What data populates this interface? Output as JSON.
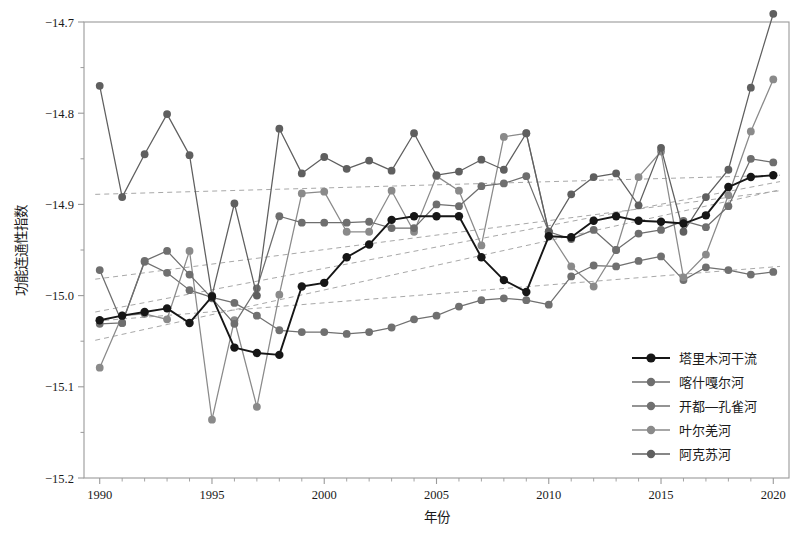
{
  "chart_data": {
    "type": "line",
    "title": "",
    "xlabel": "年份",
    "ylabel": "功能连通性指数",
    "xlim": [
      1989.3,
      2020.7
    ],
    "ylim": [
      -15.2,
      -14.7
    ],
    "grid": false,
    "legend_position": "right-bottom",
    "x_ticks": [
      1990,
      1995,
      2000,
      2005,
      2010,
      2015,
      2020
    ],
    "y_ticks": [
      -14.7,
      -14.8,
      -14.9,
      -15.0,
      -15.1,
      -15.2
    ],
    "y_tick_labels": [
      "−14.7",
      "−14.8",
      "−14.9",
      "−15.0",
      "−15.1",
      "−15.2"
    ],
    "y_minor_ticks": [
      -14.75,
      -14.85,
      -14.95,
      -15.05,
      -15.15
    ],
    "x": [
      1990,
      1991,
      1992,
      1993,
      1994,
      1995,
      1996,
      1997,
      1998,
      1999,
      2000,
      2001,
      2002,
      2003,
      2004,
      2005,
      2006,
      2007,
      2008,
      2009,
      2010,
      2011,
      2012,
      2013,
      2014,
      2015,
      2016,
      2017,
      2018,
      2019,
      2020
    ],
    "series": [
      {
        "name": "塔里木河干流",
        "color": "#161616",
        "values": [
          -15.027,
          -15.022,
          -15.018,
          -15.014,
          -15.03,
          -15.001,
          -15.057,
          -15.063,
          -15.065,
          -14.99,
          -14.986,
          -14.958,
          -14.944,
          -14.917,
          -14.913,
          -14.913,
          -14.913,
          -14.958,
          -14.983,
          -14.996,
          -14.935,
          -14.936,
          -14.918,
          -14.913,
          -14.918,
          -14.919,
          -14.921,
          -14.912,
          -14.881,
          -14.87,
          -14.868
        ],
        "trend": {
          "start": -15.046,
          "end": -14.88
        }
      },
      {
        "name": "喀什嘎尔河",
        "color": "#6e6e6e",
        "values": [
          -14.972,
          -15.03,
          -14.962,
          -14.951,
          -14.977,
          -15.003,
          -15.031,
          -14.992,
          -14.913,
          -14.92,
          -14.92,
          -14.92,
          -14.919,
          -14.926,
          -14.926,
          -14.9,
          -14.902,
          -14.88,
          -14.877,
          -14.869,
          -14.93,
          -14.938,
          -14.928,
          -14.95,
          -14.932,
          -14.928,
          -14.918,
          -14.925,
          -14.902,
          -14.85,
          -14.854
        ]
      },
      {
        "name": "开都—孔雀河",
        "color": "#707070",
        "values": [
          -15.031,
          -15.03,
          -14.963,
          -14.975,
          -14.994,
          -15.002,
          -15.008,
          -15.022,
          -15.038,
          -15.04,
          -15.04,
          -15.042,
          -15.04,
          -15.035,
          -15.026,
          -15.022,
          -15.012,
          -15.005,
          -15.003,
          -15.005,
          -15.01,
          -14.979,
          -14.967,
          -14.968,
          -14.962,
          -14.957,
          -14.983,
          -14.969,
          -14.972,
          -14.977,
          -14.974
        ]
      },
      {
        "name": "叶尔羌河",
        "color": "#8a8a8a",
        "values": [
          -15.079,
          -15.022,
          -15.02,
          -15.026,
          -14.951,
          -15.136,
          -15.027,
          -15.122,
          -14.999,
          -14.888,
          -14.886,
          -14.93,
          -14.93,
          -14.885,
          -14.93,
          -14.869,
          -14.885,
          -14.945,
          -14.826,
          -14.822,
          -14.93,
          -14.968,
          -14.99,
          -14.95,
          -14.87,
          -14.842,
          -14.98,
          -14.955,
          -14.89,
          -14.82,
          -14.763
        ]
      },
      {
        "name": "阿克苏河",
        "color": "#5f5f5f",
        "values": [
          -14.77,
          -14.892,
          -14.845,
          -14.801,
          -14.846,
          -15.0,
          -14.899,
          -15.0,
          -14.817,
          -14.866,
          -14.848,
          -14.861,
          -14.852,
          -14.863,
          -14.822,
          -14.868,
          -14.864,
          -14.851,
          -14.862,
          -14.822,
          -14.93,
          -14.889,
          -14.87,
          -14.866,
          -14.901,
          -14.838,
          -14.93,
          -14.892,
          -14.862,
          -14.772,
          -14.691
        ]
      }
    ],
    "trend_lines": [
      {
        "for": "塔里木河干流",
        "start_y": -15.049,
        "end_y": -14.884
      },
      {
        "for": "喀什嘎尔河",
        "start_y": -14.982,
        "end_y": -14.885
      },
      {
        "for": "开都—孔雀河",
        "start_y": -15.028,
        "end_y": -14.968
      },
      {
        "for": "叶尔羌河",
        "start_y": -15.018,
        "end_y": -14.875
      },
      {
        "for": "阿克苏河",
        "start_y": -14.889,
        "end_y": -14.868
      }
    ]
  },
  "legend": {
    "items": [
      {
        "label": "塔里木河干流",
        "color": "#161616"
      },
      {
        "label": "喀什嘎尔河",
        "color": "#6e6e6e"
      },
      {
        "label": "开都—孔雀河",
        "color": "#707070"
      },
      {
        "label": "叶尔羌河",
        "color": "#8a8a8a"
      },
      {
        "label": "阿克苏河",
        "color": "#5f5f5f"
      }
    ]
  },
  "axes": {
    "x_title": "年份",
    "y_title": "功能连通性指数",
    "frame_color": "#9a9a9a"
  }
}
